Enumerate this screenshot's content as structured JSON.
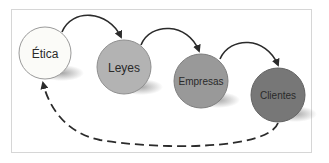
{
  "diagram": {
    "nodes": [
      {
        "id": "etica",
        "label": "Ética",
        "fill": "#fbfbf8"
      },
      {
        "id": "leyes",
        "label": "Leyes",
        "fill": "#b3b3b3"
      },
      {
        "id": "empresas",
        "label": "Empresas",
        "fill": "#999999"
      },
      {
        "id": "clientes",
        "label": "Clientes",
        "fill": "#777777"
      }
    ],
    "edges": [
      {
        "from": "etica",
        "to": "leyes",
        "style": "solid"
      },
      {
        "from": "leyes",
        "to": "empresas",
        "style": "solid"
      },
      {
        "from": "empresas",
        "to": "clientes",
        "style": "solid"
      },
      {
        "from": "clientes",
        "to": "etica",
        "style": "dashed"
      }
    ]
  }
}
